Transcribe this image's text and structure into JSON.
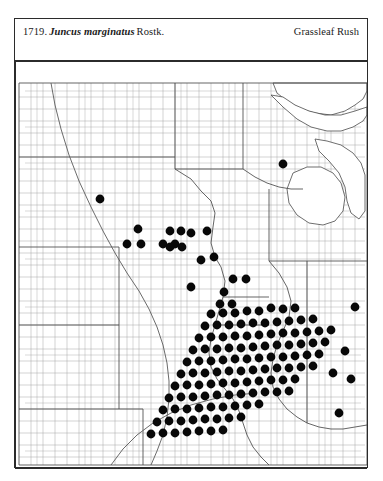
{
  "plate": {
    "number": "1719.",
    "scientific_name": "Juncus marginatus",
    "authority": "Rostk.",
    "common_name": "Grassleaf Rush"
  },
  "map": {
    "type": "county-dot-distribution-map",
    "region": "North Central United States",
    "frame": {
      "x": 0,
      "y": 0,
      "width": 354,
      "height": 408
    },
    "ink_color": "#080808",
    "county_line_color": "#9d9d9d",
    "state_line_color": "#4a4a4a",
    "dot_radius": 4.4,
    "occurrence_count": 138,
    "occurrences": [
      [
        85,
        138
      ],
      [
        268,
        103
      ],
      [
        123,
        168
      ],
      [
        155,
        170
      ],
      [
        166,
        170
      ],
      [
        148,
        183
      ],
      [
        160,
        183
      ],
      [
        112,
        183
      ],
      [
        126,
        183
      ],
      [
        176,
        172
      ],
      [
        192,
        170
      ],
      [
        155,
        186
      ],
      [
        167,
        186
      ],
      [
        186,
        199
      ],
      [
        199,
        196
      ],
      [
        176,
        226
      ],
      [
        209,
        231
      ],
      [
        218,
        218
      ],
      [
        231,
        218
      ],
      [
        205,
        243
      ],
      [
        217,
        243
      ],
      [
        196,
        253
      ],
      [
        208,
        252
      ],
      [
        220,
        252
      ],
      [
        232,
        250
      ],
      [
        244,
        250
      ],
      [
        256,
        247
      ],
      [
        268,
        248
      ],
      [
        280,
        247
      ],
      [
        190,
        265
      ],
      [
        202,
        264
      ],
      [
        214,
        264
      ],
      [
        226,
        263
      ],
      [
        238,
        262
      ],
      [
        250,
        262
      ],
      [
        262,
        261
      ],
      [
        274,
        260
      ],
      [
        286,
        259
      ],
      [
        298,
        258
      ],
      [
        184,
        277
      ],
      [
        196,
        276
      ],
      [
        208,
        276
      ],
      [
        220,
        275
      ],
      [
        232,
        275
      ],
      [
        244,
        274
      ],
      [
        256,
        273
      ],
      [
        268,
        272
      ],
      [
        280,
        272
      ],
      [
        292,
        271
      ],
      [
        304,
        270
      ],
      [
        316,
        269
      ],
      [
        178,
        289
      ],
      [
        190,
        288
      ],
      [
        202,
        288
      ],
      [
        214,
        287
      ],
      [
        226,
        287
      ],
      [
        238,
        286
      ],
      [
        250,
        285
      ],
      [
        262,
        284
      ],
      [
        274,
        284
      ],
      [
        286,
        283
      ],
      [
        298,
        282
      ],
      [
        310,
        281
      ],
      [
        172,
        301
      ],
      [
        184,
        300
      ],
      [
        196,
        300
      ],
      [
        208,
        299
      ],
      [
        220,
        298
      ],
      [
        232,
        298
      ],
      [
        244,
        297
      ],
      [
        256,
        296
      ],
      [
        268,
        296
      ],
      [
        280,
        295
      ],
      [
        292,
        294
      ],
      [
        304,
        293
      ],
      [
        166,
        313
      ],
      [
        178,
        312
      ],
      [
        190,
        312
      ],
      [
        202,
        311
      ],
      [
        214,
        310
      ],
      [
        226,
        310
      ],
      [
        238,
        309
      ],
      [
        250,
        308
      ],
      [
        262,
        307
      ],
      [
        274,
        307
      ],
      [
        286,
        306
      ],
      [
        298,
        305
      ],
      [
        160,
        325
      ],
      [
        172,
        324
      ],
      [
        184,
        324
      ],
      [
        196,
        323
      ],
      [
        208,
        322
      ],
      [
        220,
        322
      ],
      [
        232,
        321
      ],
      [
        244,
        320
      ],
      [
        256,
        319
      ],
      [
        268,
        319
      ],
      [
        280,
        318
      ],
      [
        154,
        337
      ],
      [
        166,
        336
      ],
      [
        178,
        336
      ],
      [
        190,
        335
      ],
      [
        202,
        334
      ],
      [
        214,
        334
      ],
      [
        226,
        333
      ],
      [
        238,
        332
      ],
      [
        250,
        331
      ],
      [
        262,
        331
      ],
      [
        274,
        330
      ],
      [
        148,
        349
      ],
      [
        160,
        348
      ],
      [
        172,
        348
      ],
      [
        184,
        347
      ],
      [
        196,
        346
      ],
      [
        208,
        346
      ],
      [
        220,
        345
      ],
      [
        232,
        344
      ],
      [
        244,
        343
      ],
      [
        142,
        361
      ],
      [
        154,
        360
      ],
      [
        166,
        360
      ],
      [
        178,
        359
      ],
      [
        190,
        358
      ],
      [
        202,
        358
      ],
      [
        214,
        357
      ],
      [
        226,
        356
      ],
      [
        136,
        373
      ],
      [
        148,
        372
      ],
      [
        160,
        372
      ],
      [
        172,
        371
      ],
      [
        184,
        370
      ],
      [
        196,
        370
      ],
      [
        208,
        369
      ],
      [
        330,
        290
      ],
      [
        318,
        312
      ],
      [
        336,
        318
      ],
      [
        324,
        352
      ],
      [
        340,
        246
      ]
    ]
  }
}
